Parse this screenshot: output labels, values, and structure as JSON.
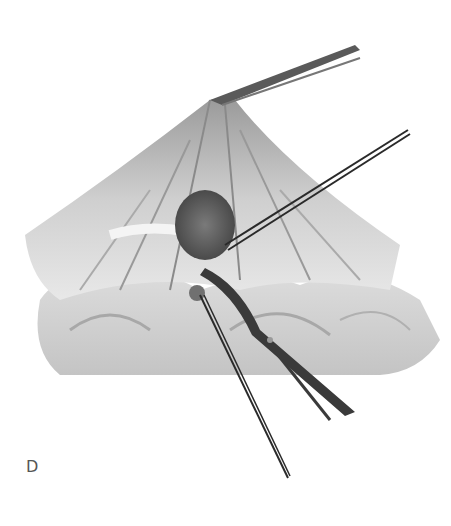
{
  "figure": {
    "panel_label": "D",
    "colors": {
      "background": "#ffffff",
      "tissue_light": "#e6e6e6",
      "tissue_mid": "#b5b5b5",
      "tissue_dark": "#6e6e6e",
      "instrument": "#2a2a2a",
      "label": "#555555"
    }
  }
}
